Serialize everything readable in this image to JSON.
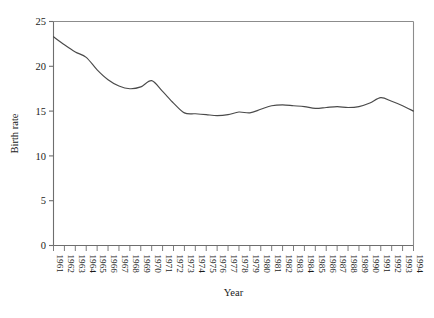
{
  "chart_data": {
    "type": "line",
    "title": "",
    "xlabel": "Year",
    "ylabel": "Birth rate",
    "xlim": [
      1961,
      1994
    ],
    "ylim": [
      0,
      25
    ],
    "yticks": [
      0,
      5,
      10,
      15,
      20,
      25
    ],
    "grid": false,
    "legend": false,
    "line_color": "#4a4a4a",
    "categories": [
      "1961",
      "1962",
      "1963",
      "1964",
      "1965",
      "1966",
      "1967",
      "1968",
      "1969",
      "1970",
      "1971",
      "1972",
      "1973",
      "1974",
      "1975",
      "1976",
      "1977",
      "1978",
      "1979",
      "1980",
      "1981",
      "1982",
      "1983",
      "1984",
      "1985",
      "1986",
      "1987",
      "1988",
      "1989",
      "1990",
      "1991",
      "1992",
      "1993",
      "1994"
    ],
    "x": [
      1961,
      1962,
      1963,
      1964,
      1965,
      1966,
      1967,
      1968,
      1969,
      1970,
      1971,
      1972,
      1973,
      1974,
      1975,
      1976,
      1977,
      1978,
      1979,
      1980,
      1981,
      1982,
      1983,
      1984,
      1985,
      1986,
      1987,
      1988,
      1989,
      1990,
      1991,
      1992,
      1993,
      1994
    ],
    "values": [
      23.3,
      22.4,
      21.6,
      21.0,
      19.6,
      18.5,
      17.8,
      17.5,
      17.7,
      18.4,
      17.2,
      15.9,
      14.8,
      14.7,
      14.6,
      14.5,
      14.6,
      14.9,
      14.8,
      15.2,
      15.6,
      15.7,
      15.6,
      15.5,
      15.3,
      15.4,
      15.5,
      15.4,
      15.5,
      15.9,
      16.5,
      16.1,
      15.6,
      15.0
    ],
    "series": [
      {
        "name": "Birth rate",
        "values": [
          23.3,
          22.4,
          21.6,
          21.0,
          19.6,
          18.5,
          17.8,
          17.5,
          17.7,
          18.4,
          17.2,
          15.9,
          14.8,
          14.7,
          14.6,
          14.5,
          14.6,
          14.9,
          14.8,
          15.2,
          15.6,
          15.7,
          15.6,
          15.5,
          15.3,
          15.4,
          15.5,
          15.4,
          15.5,
          15.9,
          16.5,
          16.1,
          15.6,
          15.0
        ]
      }
    ]
  }
}
